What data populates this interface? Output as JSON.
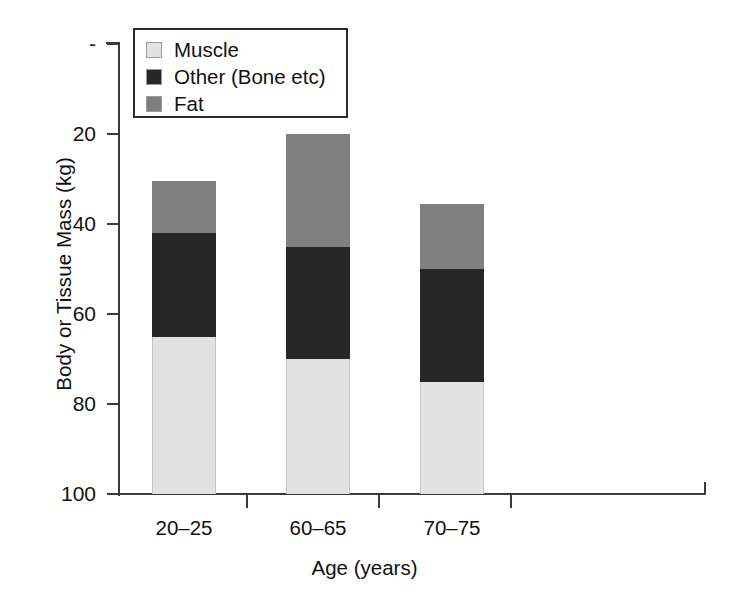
{
  "chart_data": {
    "type": "bar",
    "subtype": "stacked-vertical",
    "title": "",
    "xlabel": "Age (years)",
    "ylabel": "Body or Tissue Mass (kg)",
    "categories": [
      "20–25",
      "60–65",
      "70–75"
    ],
    "series": [
      {
        "name": "Muscle",
        "color": "#e2e2e2",
        "values": [
          35,
          30,
          25
        ]
      },
      {
        "name": "Other (Bone etc)",
        "color": "#272727",
        "values": [
          23,
          25,
          25
        ]
      },
      {
        "name": "Fat",
        "color": "#808080",
        "values": [
          11.5,
          25,
          14.5
        ]
      }
    ],
    "stack_totals": [
      69.5,
      80,
      64.5
    ],
    "ylim": [
      0,
      100
    ],
    "yticks": [
      0,
      20,
      40,
      60,
      80,
      100
    ],
    "ytick_labels": [
      "-",
      "20",
      "40",
      "60",
      "80",
      "100"
    ],
    "grid": false,
    "legend_position": "top-left",
    "stack_order_bottom_to_top": [
      "Muscle",
      "Other (Bone etc)",
      "Fat"
    ]
  },
  "legend": {
    "items": [
      {
        "label": "Muscle",
        "color": "#e2e2e2"
      },
      {
        "label": "Other (Bone etc)",
        "color": "#272727"
      },
      {
        "label": "Fat",
        "color": "#808080"
      }
    ]
  },
  "axes": {
    "y_title": "Body or Tissue Mass (kg)",
    "x_title": "Age (years)",
    "y_labels": [
      "100",
      "80",
      "60",
      "40",
      "20",
      "-"
    ],
    "x_labels": [
      "20–25",
      "60–65",
      "70–75"
    ]
  },
  "colors": {
    "muscle": "#e2e2e2",
    "other": "#272727",
    "fat": "#808080",
    "axis": "#3a3a3a",
    "text": "#111111",
    "background": "#ffffff"
  }
}
